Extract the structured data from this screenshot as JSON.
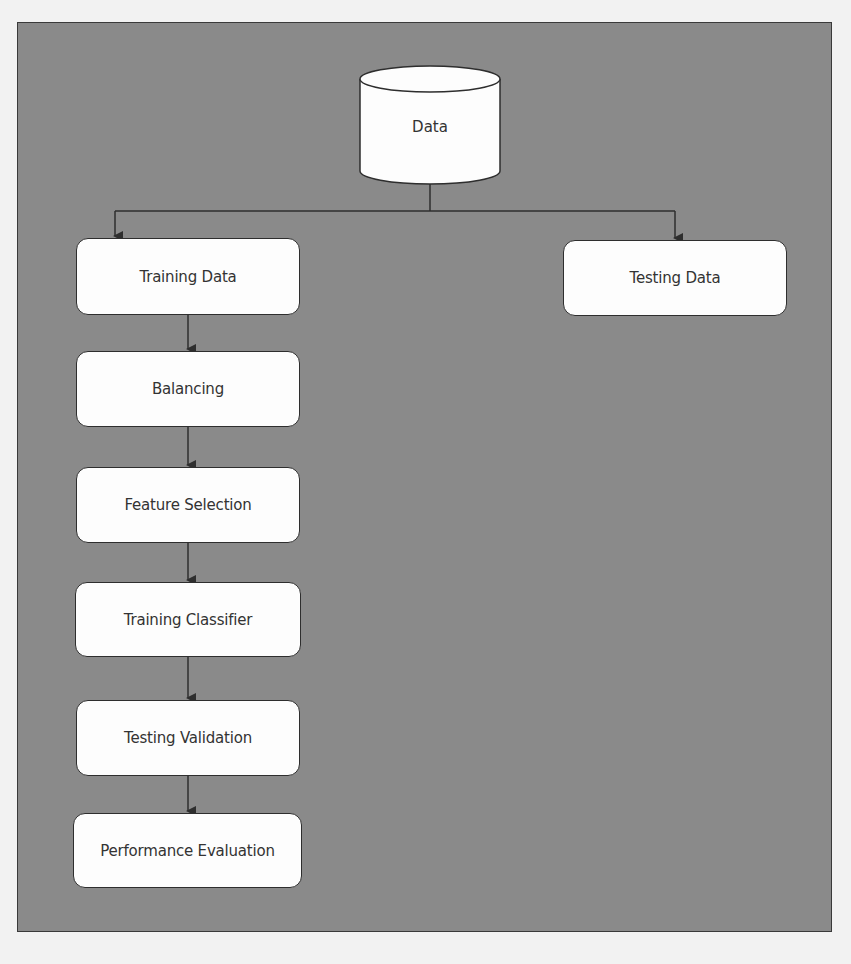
{
  "diagram": {
    "type": "flowchart",
    "background_color": "#8a8a8a",
    "node_fill": "#fdfdfd",
    "edge_color": "#2e2e2e",
    "source": {
      "label": "Data",
      "shape": "cylinder"
    },
    "branches": {
      "left": {
        "label": "Training Data"
      },
      "right": {
        "label": "Testing Data"
      }
    },
    "pipeline": [
      {
        "label": "Training Data"
      },
      {
        "label": "Balancing"
      },
      {
        "label": "Feature Selection"
      },
      {
        "label": "Training Classifier"
      },
      {
        "label": "Testing Validation"
      },
      {
        "label": "Performance Evaluation"
      }
    ],
    "edges": [
      [
        "Data",
        "Training Data"
      ],
      [
        "Data",
        "Testing Data"
      ],
      [
        "Training Data",
        "Balancing"
      ],
      [
        "Balancing",
        "Feature Selection"
      ],
      [
        "Feature Selection",
        "Training Classifier"
      ],
      [
        "Training Classifier",
        "Testing Validation"
      ],
      [
        "Testing Validation",
        "Performance Evaluation"
      ]
    ]
  }
}
